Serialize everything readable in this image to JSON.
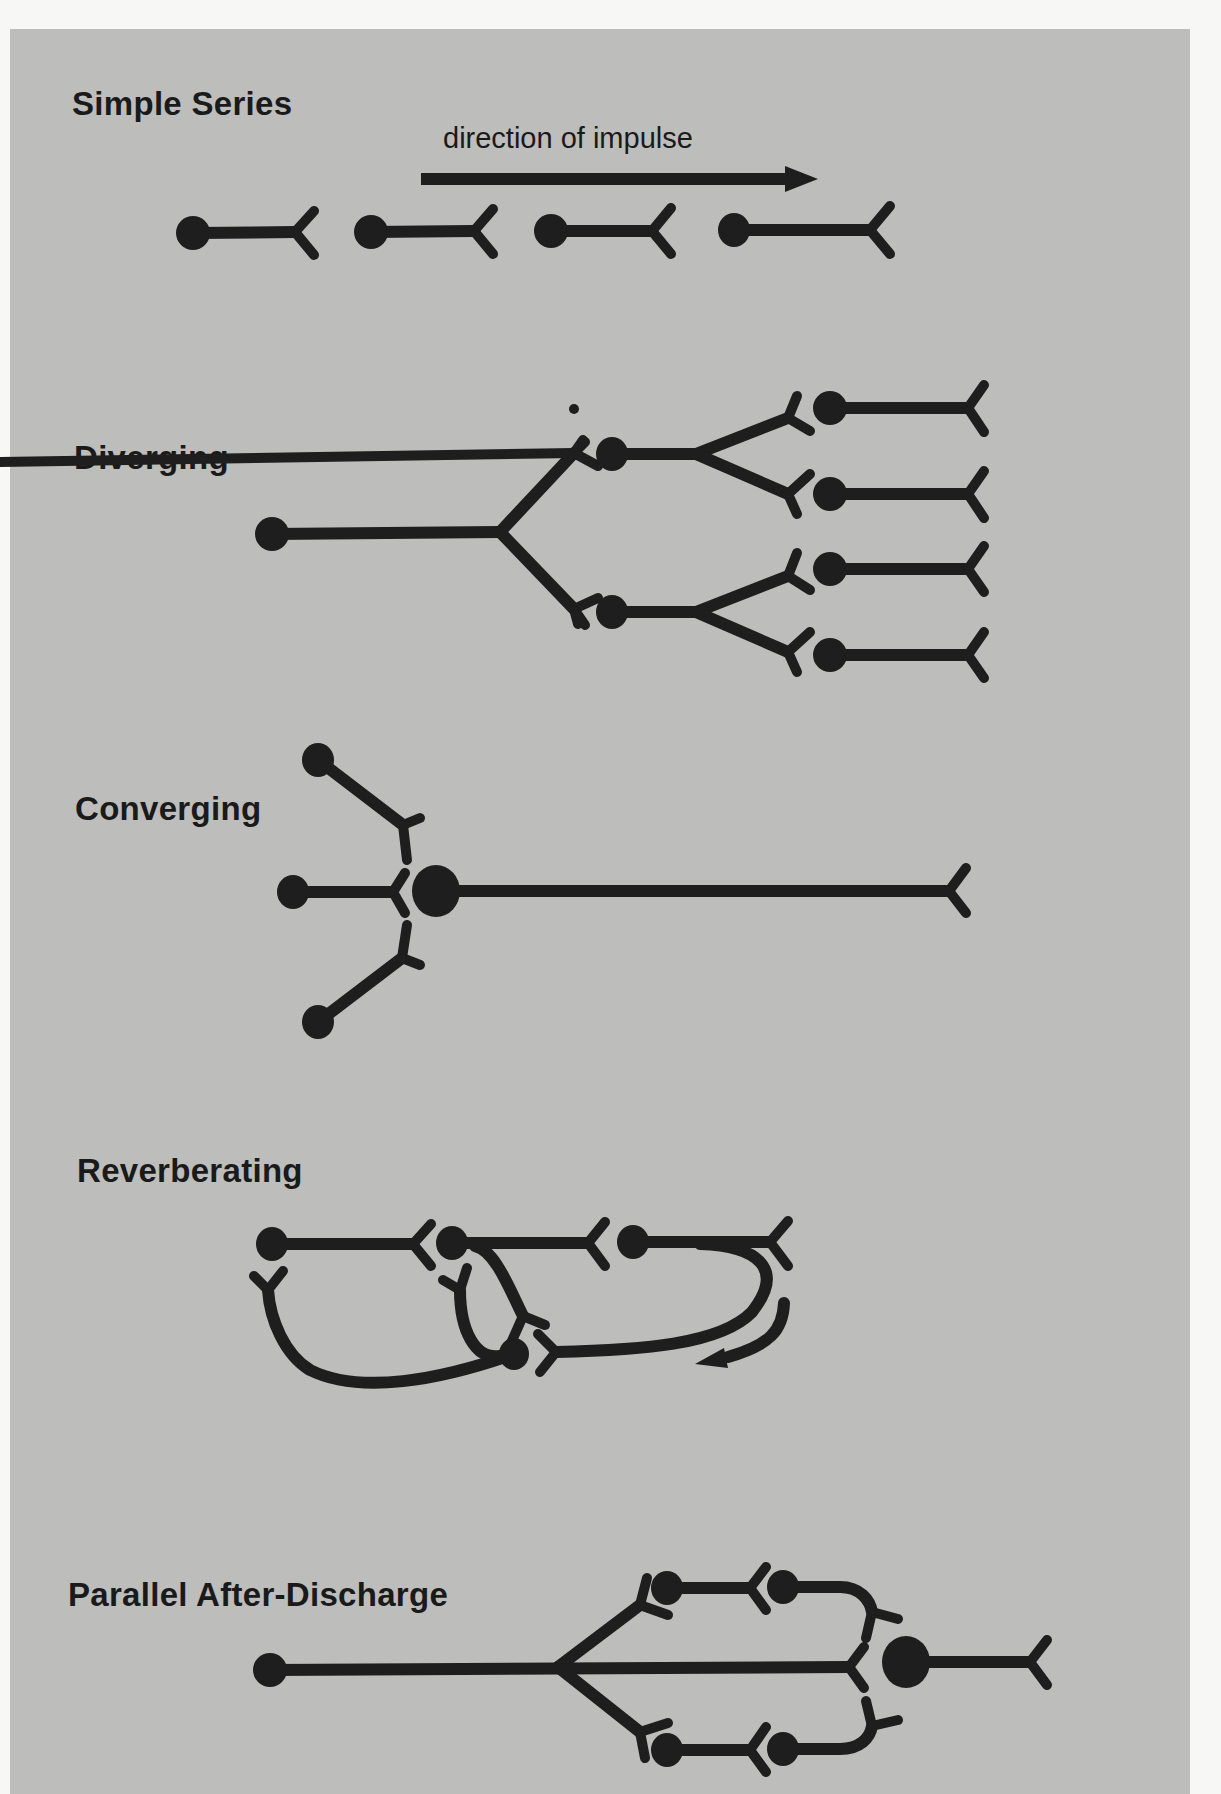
{
  "figure": {
    "background_color": "#bdbdbc",
    "ink_color": "#1e1e1e",
    "sections": [
      {
        "id": "simple-series",
        "title": "Simple Series"
      },
      {
        "id": "diverging",
        "title": "Diverging"
      },
      {
        "id": "converging",
        "title": "Converging"
      },
      {
        "id": "reverberating",
        "title": "Reverberating"
      },
      {
        "id": "parallel-after-discharge",
        "title": "Parallel After-Discharge"
      }
    ],
    "annotations": {
      "direction_label": "direction of impulse",
      "direction_arrow": "right-arrow",
      "reverberating_arrow": "curved-arrow-return"
    },
    "neuron_counts": {
      "simple_series": 4,
      "diverging": 7,
      "converging": 4,
      "reverberating": 4,
      "parallel_after_discharge": 6
    }
  }
}
